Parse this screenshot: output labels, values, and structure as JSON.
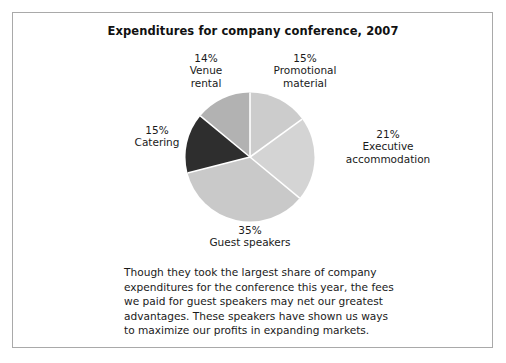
{
  "chart_title": "Expenditures for company conference, 2007",
  "body_text": "Though they took the largest share of company expenditures for the conference this year, the fees we paid for guest speakers may net our greatest advantages. These speakers have shown us ways to maximize our profits in expanding markets.",
  "labels": {
    "venue": {
      "pct": "14%",
      "name": "Venue\nrental"
    },
    "promotional": {
      "pct": "15%",
      "name": "Promotional\nmaterial"
    },
    "executive": {
      "pct": "21%",
      "name": "Executive\naccommodation"
    },
    "guest": {
      "pct": "35%",
      "name": "Guest speakers"
    },
    "catering": {
      "pct": "15%",
      "name": "Catering"
    }
  },
  "venue_pct": "14%",
  "venue_name_l1": "Venue",
  "venue_name_l2": "rental",
  "promotional_pct": "15%",
  "promotional_name_l1": "Promotional",
  "promotional_name_l2": "material",
  "executive_pct": "21%",
  "executive_name_l1": "Executive",
  "executive_name_l2": "accommodation",
  "guest_pct": "35%",
  "guest_name_l1": "Guest speakers",
  "catering_pct": "15%",
  "catering_name_l1": "Catering",
  "chart_data": {
    "type": "pie",
    "title": "Expenditures for company conference, 2007",
    "xlabel": "",
    "ylabel": "",
    "legend": "none",
    "grid": false,
    "start_angle_deg": 0,
    "direction": "clockwise",
    "units": "percent",
    "total": 100,
    "categories": [
      "Promotional material",
      "Executive accommodation",
      "Guest speakers",
      "Catering",
      "Venue rental"
    ],
    "values": [
      15,
      21,
      35,
      15,
      14
    ],
    "slices": [
      {
        "label": "Promotional material",
        "value": 15,
        "display": "15%",
        "color": "#cccccc",
        "label_position": "top-right"
      },
      {
        "label": "Executive accommodation",
        "value": 21,
        "display": "21%",
        "color": "#d4d4d4",
        "label_position": "right"
      },
      {
        "label": "Guest speakers",
        "value": 35,
        "display": "35%",
        "color": "#c9c9c9",
        "label_position": "bottom"
      },
      {
        "label": "Catering",
        "value": 15,
        "display": "15%",
        "color": "#2e2e2e",
        "label_position": "left"
      },
      {
        "label": "Venue rental",
        "value": 14,
        "display": "14%",
        "color": "#b2b2b2",
        "label_position": "top-left"
      }
    ],
    "separator_color": "#ffffff",
    "annotations": [
      "Though they took the largest share of company expenditures for the conference this year, the fees we paid for guest speakers may net our greatest advantages. These speakers have shown us ways to maximize our profits in expanding markets."
    ]
  },
  "colors": {
    "page_background": "#ffffff",
    "frame_border": "#a9a9a9",
    "text": "#1a1a1a",
    "slice_dark": "#2e2e2e",
    "slice_light": "#cccccc",
    "slice_medium": "#b2b2b2",
    "separator": "#ffffff"
  }
}
